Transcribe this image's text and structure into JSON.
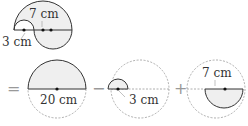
{
  "figure": {
    "top": {
      "label_large": "7 cm",
      "label_small": "3 cm"
    },
    "equation": {
      "equals": "=",
      "minus": "−",
      "plus": "+",
      "term1_label": "20 cm",
      "term2_label": "3 cm",
      "term3_label": "7 cm"
    },
    "colors": {
      "fill": "#efefef",
      "stroke": "#333333",
      "dashed": "#888888"
    }
  }
}
